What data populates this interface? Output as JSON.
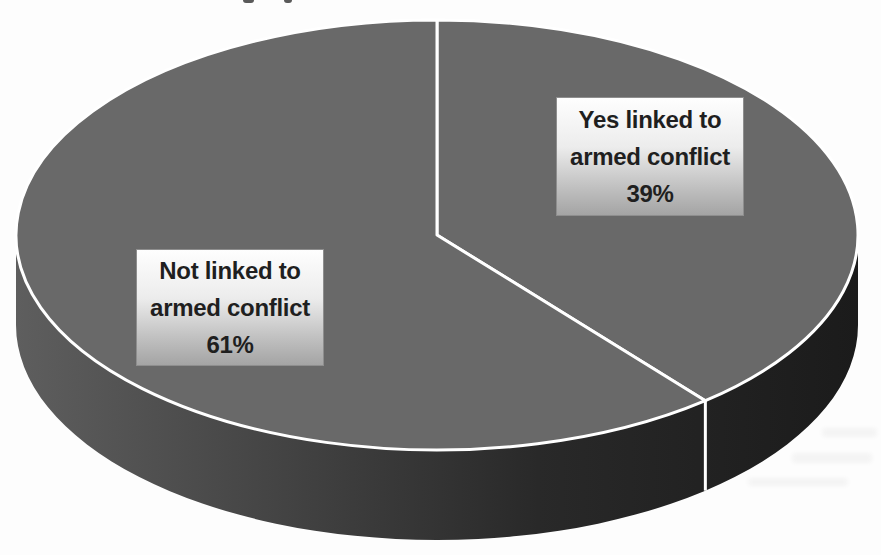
{
  "chart_data": {
    "type": "pie",
    "projection": "3d",
    "direction": "clockwise",
    "start_angle_deg": 0,
    "categories": [
      "Yes linked to armed conflict",
      "Not linked to armed conflict"
    ],
    "values": [
      39,
      61
    ],
    "unit": "%",
    "slices": [
      {
        "label_lines": [
          "Yes linked to",
          "armed conflict",
          "39%"
        ],
        "value": 39,
        "color": "#696969"
      },
      {
        "label_lines": [
          "Not linked to",
          "armed conflict",
          "61%"
        ],
        "value": 61,
        "color": "#696969"
      }
    ],
    "colors": {
      "top_face": "#696969",
      "rim_light": "#5e5e5e",
      "rim_dark": "#1b1b1b",
      "divider": "#ffffff",
      "label_text": "#1f1f1f",
      "label_box_top": "#fefefe",
      "label_box_bottom": "#a4a4a4",
      "background": "#fdfdfd"
    }
  }
}
